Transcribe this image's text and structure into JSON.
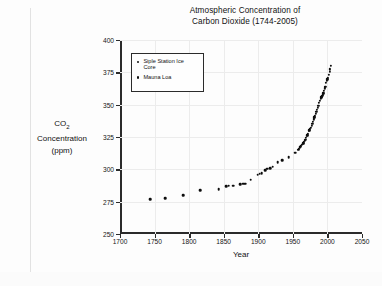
{
  "figure": {
    "title_line1": "Atmospheric Concentration of",
    "title_line2": "Carbon Dioxide (1744-2005)"
  },
  "chart_data": {
    "type": "scatter",
    "title": "Atmospheric Concentration of Carbon Dioxide (1744-2005)",
    "xlabel": "Year",
    "ylabel": "CO2 Concentration (ppm)",
    "ylabel_line1": "CO",
    "ylabel_sub": "2",
    "ylabel_line2": "Concentration",
    "ylabel_line3": "(ppm)",
    "xlim": [
      1700,
      2050
    ],
    "ylim": [
      250,
      400
    ],
    "xticks": [
      1700,
      1750,
      1800,
      1850,
      1900,
      1950,
      2000,
      2050
    ],
    "yticks": [
      250,
      275,
      300,
      325,
      350,
      375,
      400
    ],
    "grid": "faint",
    "legend_position": "upper-left-inside",
    "marker_color": "#0d0d0d",
    "axis_color": "#2b2b2b",
    "series": [
      {
        "name": "Siple Station Ice Core",
        "marker": "dot",
        "points": [
          [
            1744,
            277.0
          ],
          [
            1765,
            277.5
          ],
          [
            1791,
            280.0
          ],
          [
            1816,
            284.0
          ],
          [
            1843,
            284.5
          ],
          [
            1854,
            287.0
          ],
          [
            1857,
            287.5
          ],
          [
            1864,
            287.5
          ],
          [
            1874,
            288.5
          ],
          [
            1878,
            289.0
          ],
          [
            1881,
            289.0
          ],
          [
            1889,
            292.0
          ],
          [
            1899,
            296.0
          ],
          [
            1902,
            296.5
          ],
          [
            1905,
            297.0
          ],
          [
            1910,
            299.5
          ],
          [
            1913,
            300.5
          ],
          [
            1917,
            301.0
          ],
          [
            1921,
            302.0
          ],
          [
            1928,
            305.5
          ],
          [
            1935,
            307.0
          ],
          [
            1944,
            309.5
          ],
          [
            1953,
            313.0
          ]
        ]
      },
      {
        "name": "Mauna Loa",
        "marker": "dot",
        "points": [
          [
            1958,
            315.0
          ],
          [
            1959,
            316.0
          ],
          [
            1960,
            316.9
          ],
          [
            1961,
            317.6
          ],
          [
            1962,
            318.4
          ],
          [
            1963,
            319.0
          ],
          [
            1964,
            319.6
          ],
          [
            1965,
            320.0
          ],
          [
            1966,
            321.4
          ],
          [
            1967,
            322.2
          ],
          [
            1968,
            323.0
          ],
          [
            1969,
            324.6
          ],
          [
            1970,
            325.7
          ],
          [
            1971,
            326.3
          ],
          [
            1972,
            327.5
          ],
          [
            1973,
            329.7
          ],
          [
            1974,
            330.2
          ],
          [
            1975,
            331.1
          ],
          [
            1976,
            332.0
          ],
          [
            1977,
            333.8
          ],
          [
            1978,
            335.4
          ],
          [
            1979,
            336.8
          ],
          [
            1980,
            338.7
          ],
          [
            1981,
            340.1
          ],
          [
            1982,
            341.4
          ],
          [
            1983,
            343.0
          ],
          [
            1984,
            344.6
          ],
          [
            1985,
            346.0
          ],
          [
            1986,
            347.4
          ],
          [
            1987,
            349.2
          ],
          [
            1988,
            351.6
          ],
          [
            1989,
            353.1
          ],
          [
            1990,
            354.4
          ],
          [
            1991,
            355.6
          ],
          [
            1992,
            356.4
          ],
          [
            1993,
            357.1
          ],
          [
            1994,
            358.8
          ],
          [
            1995,
            360.8
          ],
          [
            1996,
            362.6
          ],
          [
            1997,
            363.8
          ],
          [
            1998,
            366.6
          ],
          [
            1999,
            368.3
          ],
          [
            2000,
            369.5
          ],
          [
            2001,
            371.0
          ],
          [
            2002,
            373.2
          ],
          [
            2003,
            375.6
          ],
          [
            2004,
            377.4
          ],
          [
            2005,
            379.8
          ]
        ]
      }
    ]
  },
  "legend": {
    "entries": [
      {
        "label_line1": "Siple Station Ice",
        "label_line2": "Core"
      },
      {
        "label_line1": "Mauna Loa",
        "label_line2": ""
      }
    ]
  }
}
